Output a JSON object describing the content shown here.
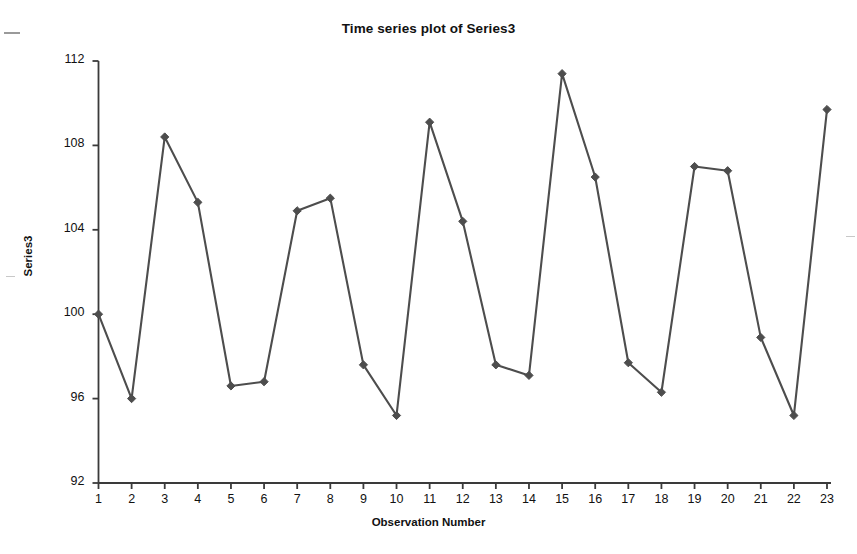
{
  "chart_data": {
    "type": "line",
    "title": "Time series plot of Series3",
    "xlabel": "Observation Number",
    "ylabel": "Series3",
    "x": [
      1,
      2,
      3,
      4,
      5,
      6,
      7,
      8,
      9,
      10,
      11,
      12,
      13,
      14,
      15,
      16,
      17,
      18,
      19,
      20,
      21,
      22,
      23
    ],
    "values": [
      100.0,
      96.0,
      108.4,
      105.3,
      96.6,
      96.8,
      104.9,
      105.5,
      97.6,
      95.2,
      109.1,
      104.4,
      97.6,
      97.1,
      111.4,
      106.5,
      97.7,
      96.3,
      107.0,
      106.8,
      98.9,
      95.2,
      109.7
    ],
    "series": [
      {
        "name": "Series3",
        "values": [
          100.0,
          96.0,
          108.4,
          105.3,
          96.6,
          96.8,
          104.9,
          105.5,
          97.6,
          95.2,
          109.1,
          104.4,
          97.6,
          97.1,
          111.4,
          106.5,
          97.7,
          96.3,
          107.0,
          106.8,
          98.9,
          95.2,
          109.7
        ]
      }
    ],
    "xtick_labels": [
      "1",
      "2",
      "3",
      "4",
      "5",
      "6",
      "7",
      "8",
      "9",
      "10",
      "11",
      "12",
      "13",
      "14",
      "15",
      "16",
      "17",
      "18",
      "19",
      "20",
      "21",
      "22",
      "23"
    ],
    "ytick_labels": [
      "92",
      "96",
      "100",
      "104",
      "108",
      "112"
    ],
    "yticks": [
      92,
      96,
      100,
      104,
      108,
      112
    ],
    "ylim": [
      92,
      112
    ],
    "xlim": [
      1,
      23
    ],
    "grid": false,
    "legend": false,
    "marker": "diamond",
    "line_color": "#4d4d4d",
    "marker_color": "#4d4d4d",
    "axis_color": "#3a3a3a",
    "background": "#ffffff"
  }
}
